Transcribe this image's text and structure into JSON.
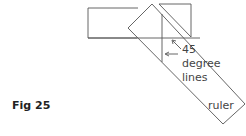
{
  "diagram": {
    "labels": {
      "angle_value": "45",
      "angle_line1": "degree",
      "angle_line2": "lines",
      "ruler": "ruler"
    },
    "caption": "Fig 25",
    "colors": {
      "stroke": "#555555",
      "text": "#444444"
    }
  }
}
